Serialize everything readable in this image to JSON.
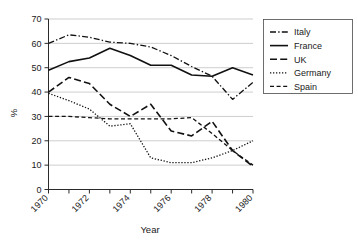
{
  "chart_data": {
    "type": "line",
    "title": "",
    "xlabel": "Year",
    "ylabel": "%",
    "xlim": [
      1970,
      1980
    ],
    "ylim": [
      0,
      70
    ],
    "grid": true,
    "legend_position": "right",
    "x": [
      1970,
      1971,
      1972,
      1973,
      1974,
      1975,
      1976,
      1977,
      1978,
      1979,
      1980
    ],
    "x_tick_labels": [
      "1970",
      "1972",
      "1974",
      "1976",
      "1978",
      "1980"
    ],
    "x_tick_values": [
      1970,
      1972,
      1974,
      1976,
      1978,
      1980
    ],
    "y_tick_labels": [
      "0",
      "10",
      "20",
      "30",
      "40",
      "50",
      "60",
      "70"
    ],
    "y_tick_values": [
      0,
      10,
      20,
      30,
      40,
      50,
      60,
      70
    ],
    "series": [
      {
        "name": "Italy",
        "style": "dash-dot",
        "values": [
          60,
          63.5,
          62.5,
          60.5,
          60,
          58.5,
          55,
          50.5,
          46.5,
          37,
          44
        ]
      },
      {
        "name": "France",
        "style": "solid",
        "values": [
          49,
          52.5,
          54,
          58,
          55,
          51,
          51,
          47,
          46.5,
          50,
          47
        ]
      },
      {
        "name": "UK",
        "style": "long-dash",
        "values": [
          40,
          46,
          43.5,
          35,
          30,
          35,
          24,
          22,
          28,
          16,
          9.5
        ]
      },
      {
        "name": "Germany",
        "style": "dotted",
        "values": [
          39.5,
          36.5,
          33,
          26,
          27,
          13,
          11,
          11,
          13,
          16,
          20
        ]
      },
      {
        "name": "Spain",
        "style": "dashed",
        "values": [
          30,
          30,
          29.5,
          29,
          29,
          29,
          29,
          29.5,
          23,
          16,
          10
        ]
      }
    ]
  },
  "legend": {
    "entries": [
      {
        "label": "Italy"
      },
      {
        "label": "France"
      },
      {
        "label": "UK"
      },
      {
        "label": "Germany"
      },
      {
        "label": "Spain"
      }
    ]
  },
  "colors": {
    "line": "#111111",
    "grid": "#b8b8b8",
    "axis": "#2b2b2b",
    "background": "#ffffff"
  }
}
